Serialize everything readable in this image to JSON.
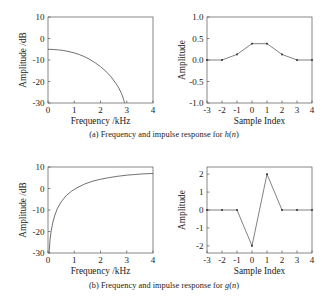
{
  "figure": {
    "background": "#ffffff",
    "line_color": "#4b4b4b",
    "axis_color": "#555555",
    "text_color": "#1a1a1a"
  },
  "captions": {
    "a_prefix": "(a) Frequency and impulse response for ",
    "a_symbol": "h",
    "a_arg": "(n)",
    "b_prefix": "(b) Frequency and impulse response for ",
    "b_symbol": "g",
    "b_arg": "(n)"
  },
  "chart_data": [
    {
      "id": "panel-a-frequency",
      "type": "line",
      "title": "",
      "xlabel": "Frequency /kHz",
      "ylabel": "Amplitude /dB",
      "xlim": [
        0,
        4
      ],
      "ylim": [
        -30,
        10
      ],
      "xticks": [
        0,
        1,
        2,
        3,
        4
      ],
      "xticklabels": [
        "0",
        "1",
        "2",
        "3",
        "4"
      ],
      "yticks": [
        -30,
        -20,
        -10,
        0,
        10
      ],
      "yticklabels": [
        "-30",
        "-20",
        "-10",
        "0",
        "10"
      ],
      "grid": false,
      "legend": null,
      "x": [
        0.0,
        0.2,
        0.4,
        0.6,
        0.8,
        1.0,
        1.2,
        1.4,
        1.6,
        1.8,
        2.0,
        2.2,
        2.4,
        2.6,
        2.7,
        2.8,
        2.85,
        2.9,
        2.95,
        2.98,
        3.0
      ],
      "y": [
        -5.0,
        -5.1,
        -5.3,
        -5.6,
        -6.1,
        -6.7,
        -7.5,
        -8.5,
        -9.8,
        -11.3,
        -13.1,
        -15.2,
        -17.8,
        -21.1,
        -23.1,
        -25.6,
        -27.2,
        -29.2,
        -32.0,
        -34.5,
        -38.0
      ]
    },
    {
      "id": "panel-a-impulse",
      "type": "line",
      "title": "",
      "xlabel": "Sample Index",
      "ylabel": "Amplitude",
      "xlim": [
        -3,
        4
      ],
      "ylim": [
        -1.0,
        1.0
      ],
      "xticks": [
        -3,
        -2,
        -1,
        0,
        1,
        2,
        3,
        4
      ],
      "xticklabels": [
        "-3",
        "-2",
        "-1",
        "0",
        "1",
        "2",
        "3",
        "4"
      ],
      "yticks": [
        -1.0,
        -0.5,
        0.0,
        0.5,
        1.0
      ],
      "yticklabels": [
        "-1.0",
        "-0.5",
        "0.0",
        "0.5",
        "1.0"
      ],
      "grid": false,
      "legend": null,
      "markers": true,
      "x": [
        -3,
        -2,
        -1,
        0,
        1,
        2,
        3,
        4
      ],
      "y": [
        0.0,
        0.0,
        0.13,
        0.38,
        0.38,
        0.13,
        0.0,
        0.0
      ]
    },
    {
      "id": "panel-b-frequency",
      "type": "line",
      "title": "",
      "xlabel": "Frequency /kHz",
      "ylabel": "Amplitude /dB",
      "xlim": [
        0,
        4
      ],
      "ylim": [
        -30,
        10
      ],
      "xticks": [
        0,
        1,
        2,
        3,
        4
      ],
      "xticklabels": [
        "0",
        "1",
        "2",
        "3",
        "4"
      ],
      "yticks": [
        -30,
        -20,
        -10,
        0,
        10
      ],
      "yticklabels": [
        "-30",
        "-20",
        "-10",
        "0",
        "10"
      ],
      "grid": false,
      "legend": null,
      "x": [
        0.04,
        0.08,
        0.12,
        0.18,
        0.25,
        0.35,
        0.5,
        0.7,
        0.9,
        1.1,
        1.4,
        1.7,
        2.0,
        2.3,
        2.6,
        3.0,
        3.3,
        3.6,
        3.8,
        4.0
      ],
      "y": [
        -30.0,
        -23.5,
        -19.8,
        -16.0,
        -12.8,
        -9.5,
        -6.2,
        -3.2,
        -1.2,
        0.3,
        2.1,
        3.4,
        4.3,
        5.0,
        5.6,
        6.2,
        6.5,
        6.8,
        6.9,
        7.0
      ]
    },
    {
      "id": "panel-b-impulse",
      "type": "line",
      "title": "",
      "xlabel": "Sample Index",
      "ylabel": "Amplitude",
      "xlim": [
        -3,
        4
      ],
      "ylim": [
        -2.4,
        2.4
      ],
      "xticks": [
        -3,
        -2,
        -1,
        0,
        1,
        2,
        3,
        4
      ],
      "xticklabels": [
        "-3",
        "-2",
        "-1",
        "0",
        "1",
        "2",
        "3",
        "4"
      ],
      "yticks": [
        -2,
        -1,
        0,
        1,
        2
      ],
      "yticklabels": [
        "-2",
        "-1",
        "0",
        "1",
        "2"
      ],
      "grid": false,
      "legend": null,
      "markers": true,
      "x": [
        -3,
        -2,
        -1,
        0,
        1,
        2,
        3,
        4
      ],
      "y": [
        0,
        0,
        0,
        -2,
        2,
        0,
        0,
        0
      ]
    }
  ]
}
